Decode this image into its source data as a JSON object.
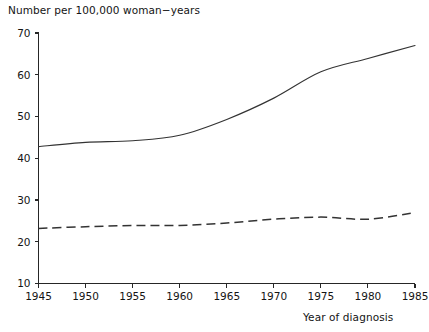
{
  "chart_data": {
    "type": "line",
    "title": "Number per 100,000 woman−years",
    "subtitle": "",
    "xlabel": "Year of diagnosis",
    "ylabel": "Number per 100,000 woman−years",
    "xlim": [
      1945,
      1985
    ],
    "ylim": [
      10,
      70
    ],
    "grid": false,
    "legend_position": "none",
    "x_ticks": [
      1945,
      1950,
      1955,
      1960,
      1965,
      1970,
      1975,
      1980,
      1985
    ],
    "x_tick_labels": [
      "1945",
      "1950",
      "1955",
      "1960",
      "1965",
      "1970",
      "1975",
      "1980",
      "1985"
    ],
    "y_ticks": [
      10,
      20,
      30,
      40,
      50,
      60,
      70
    ],
    "y_tick_labels": [
      "10",
      "20",
      "30",
      "40",
      "50",
      "60",
      "70"
    ],
    "x": [
      1945,
      1950,
      1955,
      1960,
      1965,
      1970,
      1975,
      1980,
      1985
    ],
    "series": [
      {
        "name": "solid-series",
        "style": "solid",
        "color": "#333333",
        "values": [
          42.8,
          43.8,
          44.2,
          45.5,
          49.3,
          54.4,
          60.7,
          63.9,
          67.0
        ]
      },
      {
        "name": "dashed-series",
        "style": "dashed",
        "color": "#333333",
        "values": [
          23.2,
          23.6,
          23.9,
          23.9,
          24.5,
          25.4,
          25.9,
          25.4,
          27.0
        ]
      }
    ]
  },
  "axes": {
    "title_text": "Number per 100,000 woman−years",
    "x_caption": "Year of diagnosis"
  }
}
